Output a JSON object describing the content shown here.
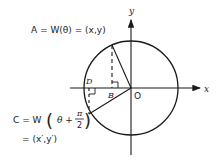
{
  "diagram": {
    "labels": {
      "axis_x": "x",
      "axis_y": "y",
      "origin": "O",
      "point_b": "B",
      "point_d": "D",
      "eq_a": "A = W(θ) = (x,y)",
      "eq_c_prefix": "C = W",
      "eq_c_theta": "θ +",
      "eq_c_pi": "π",
      "eq_c_two": "2",
      "eq_c_result": "= (x′,y′)"
    },
    "geometry": {
      "origin": [
        131,
        88
      ],
      "radius": 47,
      "point_a": [
        112,
        45
      ],
      "point_c": [
        89,
        114
      ],
      "foot_a": [
        112,
        88
      ],
      "foot_c": [
        89,
        88
      ]
    },
    "colors": {
      "stroke": "#1a1a1a",
      "background": "#ffffff"
    }
  }
}
